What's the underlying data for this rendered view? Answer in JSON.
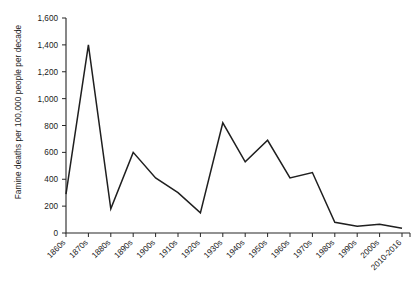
{
  "chart_data": {
    "type": "line",
    "title": "",
    "xlabel": "",
    "ylabel": "Famine deaths per 100,000 people per decade",
    "ylim": [
      0,
      1600
    ],
    "y_ticks": [
      0,
      200,
      400,
      600,
      800,
      1000,
      1200,
      1400,
      1600
    ],
    "y_tick_labels": [
      "0",
      "200",
      "400",
      "600",
      "800",
      "1,000",
      "1,200",
      "1,400",
      "1,600"
    ],
    "grid": false,
    "legend": "none",
    "categories": [
      "1860s",
      "1870s",
      "1880s",
      "1890s",
      "1900s",
      "1910s",
      "1920s",
      "1930s",
      "1940s",
      "1950s",
      "1960s",
      "1970s",
      "1980s",
      "1990s",
      "2000s",
      "2010-2016"
    ],
    "values": [
      290,
      1400,
      180,
      600,
      410,
      300,
      150,
      820,
      530,
      690,
      410,
      450,
      80,
      50,
      65,
      35
    ],
    "series": [
      {
        "name": "Famine deaths",
        "color": "#1f1f1f",
        "values": [
          290,
          1400,
          180,
          600,
          410,
          300,
          150,
          820,
          530,
          690,
          410,
          450,
          80,
          50,
          65,
          35
        ]
      }
    ]
  },
  "axes": {
    "y_title": "Famine deaths per 100,000 people per decade"
  },
  "colors": {
    "line": "#1f1f1f",
    "axis": "#262626",
    "background": "#ffffff",
    "text": "#1a1a1a"
  }
}
